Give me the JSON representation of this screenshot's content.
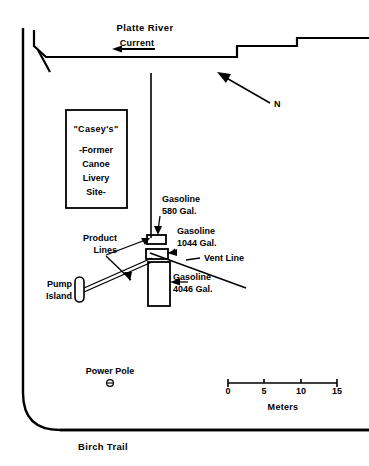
{
  "figure": {
    "type": "site-plan-map"
  },
  "river": {
    "name": "Platte River",
    "current_label": "Current",
    "current_direction": "left"
  },
  "compass": {
    "label": "N",
    "direction": "up-left"
  },
  "building": {
    "name": "\"Casey's\"",
    "line1": "-Former",
    "line2": "Canoe",
    "line3": "Livery",
    "line4": "Site-"
  },
  "tanks": [
    {
      "id": "tank-580",
      "product": "Gasoline",
      "capacity": "580 Gal.",
      "label_line1": "Gasoline",
      "label_line2": "580 Gal."
    },
    {
      "id": "tank-1044",
      "product": "Gasoline",
      "capacity": "1044 Gal.",
      "label_line1": "Gasoline",
      "label_line2": "1044 Gal."
    },
    {
      "id": "tank-4046",
      "product": "Gasoline",
      "capacity": "4046 Gal.",
      "label_line1": "Gasoline",
      "label_line2": "4046 Gal."
    }
  ],
  "features": {
    "product_lines_line1": "Product",
    "product_lines_line2": "Lines",
    "vent_line": "Vent Line",
    "pump_island_line1": "Pump",
    "pump_island_line2": "Island",
    "power_pole": "Power Pole",
    "birch_trail": "Birch Trail"
  },
  "scale": {
    "ticks": [
      "0",
      "5",
      "10",
      "15"
    ],
    "units": "Meters",
    "min": 0,
    "max": 15
  },
  "colors": {
    "ink": "#000000",
    "paper": "#ffffff"
  }
}
